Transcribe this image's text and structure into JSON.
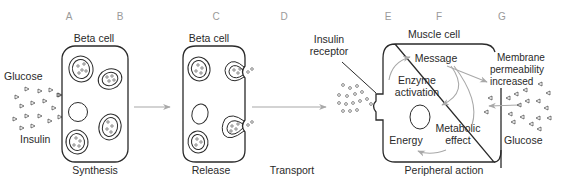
{
  "stage_letters": [
    "A",
    "B",
    "C",
    "D",
    "E",
    "F",
    "G"
  ],
  "panels": {
    "synthesis": {
      "cell_label": "Beta cell",
      "caption": "Synthesis",
      "left_labels": {
        "top": "Glucose",
        "bottom": "Insulin"
      }
    },
    "release": {
      "cell_label": "Beta cell",
      "caption": "Release"
    },
    "transport": {
      "caption": "Transport"
    },
    "peripheral": {
      "cell_label": "Muscle cell",
      "caption": "Peripheral action",
      "receptor_label": [
        "Insulin",
        "receptor"
      ],
      "inner_labels": {
        "message": "Message",
        "enzyme": [
          "Enzyme",
          "activation"
        ],
        "metabolic": [
          "Metabolic",
          "effect"
        ],
        "energy": "Energy"
      },
      "right_labels": {
        "membrane": [
          "Membrane",
          "permeability",
          "increased"
        ],
        "glucose": "Glucose"
      }
    }
  },
  "colors": {
    "line": "#2a2a2a",
    "arrow_grey": "#a8a8a8",
    "stage_letter": "#9a9a9a"
  }
}
